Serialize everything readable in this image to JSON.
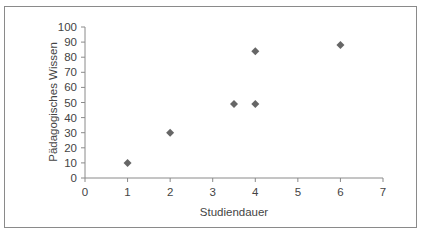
{
  "chart_data": {
    "type": "scatter",
    "title": "",
    "xlabel": "Studiendauer",
    "ylabel": "Pädagogisches Wissen",
    "xlim": [
      0,
      7
    ],
    "ylim": [
      0,
      100
    ],
    "x_ticks": [
      "0",
      "1",
      "2",
      "3",
      "4",
      "5",
      "6",
      "7"
    ],
    "y_ticks": [
      "0",
      "10",
      "20",
      "30",
      "40",
      "50",
      "60",
      "70",
      "80",
      "90",
      "100"
    ],
    "grid": false,
    "legend": null,
    "marker": "diamond",
    "marker_color": "#666666",
    "series": [
      {
        "name": "",
        "points": [
          {
            "x": 1,
            "y": 10
          },
          {
            "x": 2,
            "y": 30
          },
          {
            "x": 3.5,
            "y": 49
          },
          {
            "x": 4,
            "y": 49
          },
          {
            "x": 4,
            "y": 84
          },
          {
            "x": 6,
            "y": 88
          }
        ]
      }
    ]
  }
}
